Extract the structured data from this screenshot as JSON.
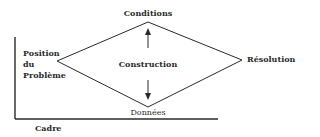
{
  "diagram": {
    "labels": {
      "top": "Conditions",
      "bottom": "Données",
      "left": [
        "Position",
        "du",
        "Problème"
      ],
      "right": "Résolution",
      "center": "Construction",
      "frame": "Cadre"
    },
    "arrows": [
      {
        "from": "Construction",
        "to": "Conditions",
        "direction": "up"
      },
      {
        "from": "Construction",
        "to": "Données",
        "direction": "down"
      }
    ],
    "colors": {
      "line": "#2a2a2a",
      "text": "#2a2a2a",
      "background": "#ffffff"
    }
  }
}
